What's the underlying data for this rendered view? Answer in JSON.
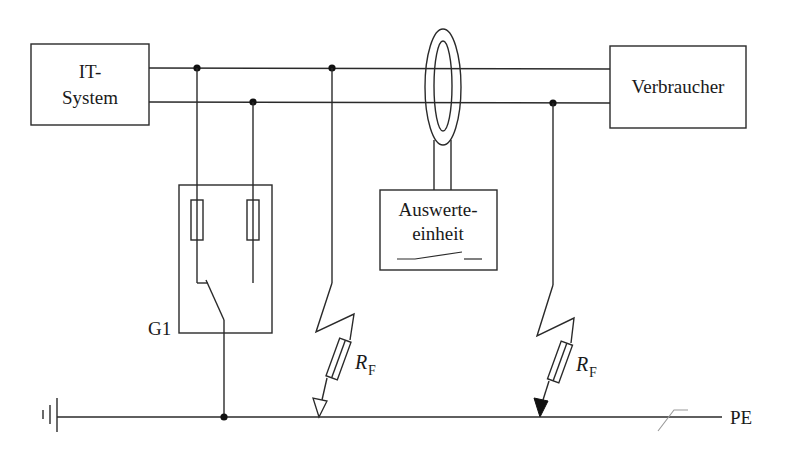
{
  "diagram": {
    "type": "electrical-schematic",
    "blocks": {
      "source": {
        "line1": "IT-",
        "line2": "System"
      },
      "load": {
        "label": "Verbraucher"
      },
      "evaluator": {
        "line1": "Auswerte-",
        "line2": "einheit"
      },
      "generator": {
        "label": "G1"
      }
    },
    "fault_resistors": [
      {
        "symbol": "R",
        "subscript": "F",
        "arrow": "open"
      },
      {
        "symbol": "R",
        "subscript": "F",
        "arrow": "filled"
      }
    ],
    "earth": {
      "label": "PE"
    },
    "colors": {
      "line": "#2a2a2a",
      "junction": "#111111",
      "background": "#ffffff"
    }
  }
}
